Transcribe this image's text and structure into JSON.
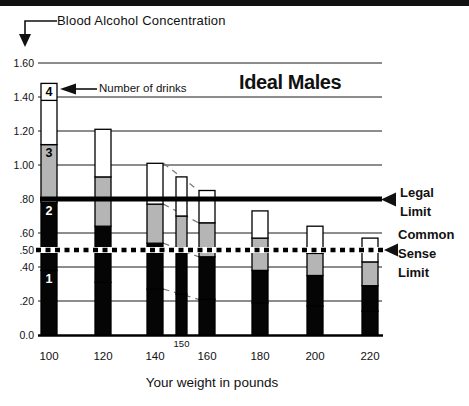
{
  "labels": {
    "bac_axis": "Blood Alcohol Concentration",
    "number_of_drinks": "Number of drinks",
    "legal_limit": "Legal Limit",
    "common_sense_limit": "Common Sense Limit"
  },
  "chart_data": {
    "type": "bar",
    "stacked": true,
    "title": "Ideal Males",
    "xlabel": "Your weight in pounds",
    "ylabel": "Blood Alcohol Concentration",
    "categories": [
      "100",
      "120",
      "140",
      "150",
      "160",
      "180",
      "200",
      "220"
    ],
    "ylim": [
      0,
      1.6
    ],
    "yticks": [
      "1.60",
      "1.40",
      "1.20",
      "1.00",
      ".80",
      ".60",
      ".50",
      ".40",
      ".20",
      "0.0"
    ],
    "ytick_values": [
      1.6,
      1.4,
      1.2,
      1.0,
      0.8,
      0.6,
      0.5,
      0.4,
      0.2,
      0.0
    ],
    "gridline_values": [
      1.6,
      1.4,
      1.2,
      1.0,
      0.6,
      0.4,
      0.2
    ],
    "drink_segment_labels": [
      "1",
      "2",
      "3",
      "4"
    ],
    "series": [
      {
        "name": "1 drink",
        "cumulative_bac": [
          0.38,
          0.31,
          0.27,
          0.24,
          0.21,
          0.19,
          0.17,
          0.14
        ]
      },
      {
        "name": "2 drinks",
        "cumulative_bac": [
          0.78,
          0.64,
          0.54,
          0.5,
          0.46,
          0.38,
          0.35,
          0.29
        ]
      },
      {
        "name": "3 drinks",
        "cumulative_bac": [
          1.12,
          0.93,
          0.77,
          0.7,
          0.66,
          0.57,
          0.48,
          0.43
        ]
      },
      {
        "name": "4 drinks",
        "cumulative_bac": [
          1.48,
          1.21,
          1.01,
          0.93,
          0.85,
          0.73,
          0.64,
          0.57
        ]
      }
    ],
    "reference_lines": [
      {
        "label": "Legal Limit",
        "value": 0.8,
        "style": "solid-thick"
      },
      {
        "label": "Common Sense Limit",
        "value": 0.5,
        "style": "dashed"
      }
    ],
    "interpolation_connectors": {
      "between_categories": [
        "140",
        "160"
      ],
      "through": "150"
    },
    "colors": {
      "drink1": "#050505",
      "drink2": "#050505",
      "drink3": "#b5b5b5",
      "drink4": "#ffffff",
      "grid": "#1a1a1a",
      "limit_line": "#000000"
    }
  }
}
